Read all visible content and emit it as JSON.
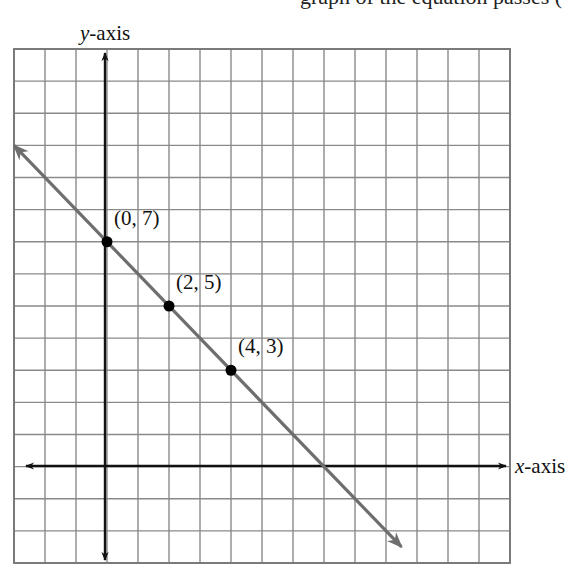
{
  "caption_fragment": "graph of the equation passes (",
  "colors": {
    "grid": "#8a8a8a",
    "axis": "#111111",
    "line": "#6e6e6e",
    "point": "#000000",
    "background": "#ffffff"
  },
  "labels": {
    "y_axis_var": "y",
    "y_axis_suffix": "-axis",
    "x_axis_var": "x",
    "x_axis_suffix": "-axis"
  },
  "points": [
    {
      "label": "(0, 7)",
      "x": 0,
      "y": 7
    },
    {
      "label": "(2, 5)",
      "x": 2,
      "y": 5
    },
    {
      "label": "(4, 3)",
      "x": 4,
      "y": 3
    }
  ],
  "chart_data": {
    "type": "line",
    "title": "",
    "xlabel": "x-axis",
    "ylabel": "y-axis",
    "xlim": [
      -3,
      13
    ],
    "ylim": [
      -3,
      13
    ],
    "grid": true,
    "grid_step": 1,
    "series": [
      {
        "name": "x + y = 7",
        "x": [
          -3,
          9.5
        ],
        "y": [
          10,
          -2.5
        ],
        "arrows_both_ends": true
      }
    ],
    "marked_points": [
      {
        "label": "(0, 7)",
        "x": 0,
        "y": 7
      },
      {
        "label": "(2, 5)",
        "x": 2,
        "y": 5
      },
      {
        "label": "(4, 3)",
        "x": 4,
        "y": 3
      }
    ],
    "x_intercept": 7,
    "y_intercept": 7,
    "legend": "none"
  }
}
